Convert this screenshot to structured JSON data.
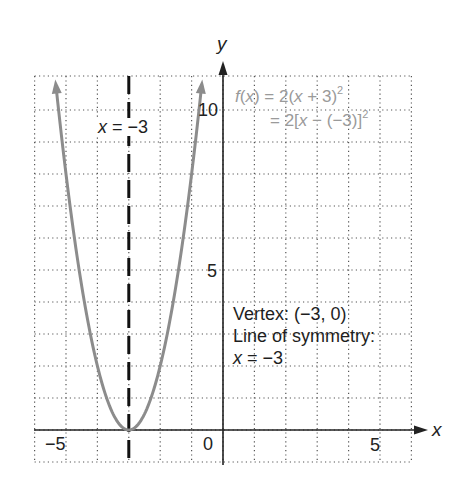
{
  "chart_data": {
    "type": "line",
    "title": "",
    "function": "f(x) = 2(x + 3)^2",
    "series": [
      {
        "name": "f(x) = 2(x + 3)^2",
        "color": "#8c8c8c",
        "x": [
          -5.3,
          -5,
          -4.5,
          -4,
          -3.5,
          -3,
          -2.5,
          -2,
          -1.5,
          -1,
          -0.7
        ],
        "y": [
          10.58,
          8,
          4.5,
          2,
          0.5,
          0,
          0.5,
          2,
          4.5,
          8,
          10.58
        ]
      }
    ],
    "vertex": {
      "x": -3,
      "y": 0
    },
    "axis_of_symmetry": {
      "x": -3,
      "style": "dashed",
      "color": "#111111"
    },
    "xlabel": "x",
    "ylabel": "y",
    "xlim": [
      -6,
      6
    ],
    "ylim": [
      -1,
      11
    ],
    "x_ticks_labeled": [
      -5,
      0,
      5
    ],
    "y_ticks_labeled": [
      5,
      10
    ],
    "grid": true,
    "grid_style": "dotted",
    "annotations": [
      "x = −3",
      "f(x) = 2(x + 3)²",
      "= 2[x − (−3)]²",
      "Vertex: (−3, 0)",
      "Line of symmetry:",
      "x = −3"
    ]
  },
  "axes": {
    "x_name": "x",
    "y_name": "y",
    "tick_labels": {
      "x_neg5": "−5",
      "x_0": "0",
      "x_5": "5",
      "y_5": "5",
      "y_10": "10"
    }
  },
  "labels": {
    "symmetry_line_label": {
      "var": "x",
      "rest": " = −3"
    },
    "formula": {
      "line1_f": "f",
      "line1_open": "(",
      "line1_x": "x",
      "line1_mid": ") = 2(",
      "line1_x2": "x",
      "line1_end": " + 3)",
      "line1_exp": "2",
      "line2_start": "= 2[",
      "line2_x": "x",
      "line2_end": " − (−3)]",
      "line2_exp": "2"
    },
    "vertex_text": "Vertex: (−3, 0)",
    "symmetry_title": "Line of symmetry:",
    "symmetry_eq_var": "x",
    "symmetry_eq_rest": " = −3"
  }
}
